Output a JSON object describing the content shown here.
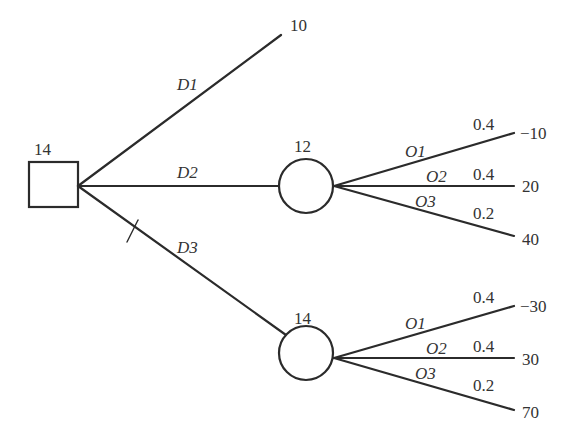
{
  "diagram": {
    "type": "decision-tree",
    "decision_node": {
      "value": "14"
    },
    "branches": [
      {
        "label": "D1",
        "payoff": "10"
      },
      {
        "label": "D2",
        "chance_value": "12",
        "outcomes": [
          {
            "label": "O1",
            "prob": "0.4",
            "payoff": "−10"
          },
          {
            "label": "O2",
            "prob": "0.4",
            "payoff": "20"
          },
          {
            "label": "O3",
            "prob": "0.2",
            "payoff": "40"
          }
        ]
      },
      {
        "label": "D3",
        "chance_value": "14",
        "pruned": false,
        "outcomes": [
          {
            "label": "O1",
            "prob": "0.4",
            "payoff": "−30"
          },
          {
            "label": "O2",
            "prob": "0.4",
            "payoff": "30"
          },
          {
            "label": "O3",
            "prob": "0.2",
            "payoff": "70"
          }
        ]
      }
    ]
  }
}
